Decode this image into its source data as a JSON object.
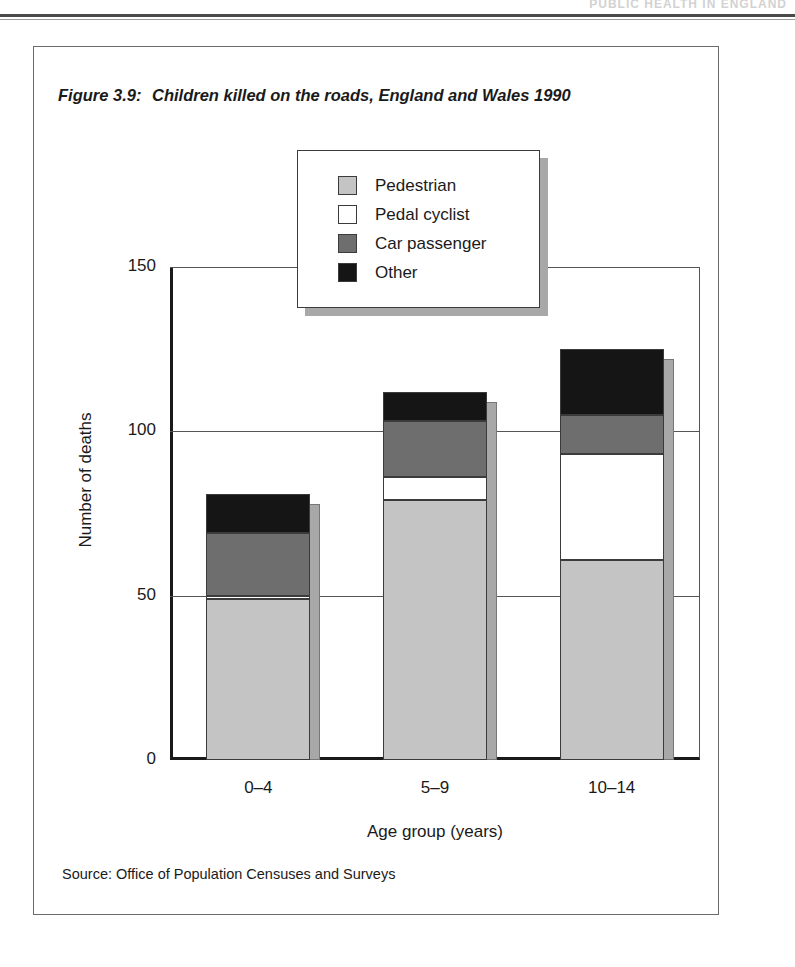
{
  "page_header": {
    "running_head": "PUBLIC HEALTH IN ENGLAND"
  },
  "figure": {
    "number_label": "Figure 3.9:",
    "caption": "Children killed on the roads, England and Wales 1990",
    "source": "Source: Office of Population Censuses and Surveys"
  },
  "legend": {
    "entries": [
      {
        "label": "Pedestrian",
        "color": "#c4c4c4"
      },
      {
        "label": "Pedal cyclist",
        "color": "#ffffff"
      },
      {
        "label": "Car passenger",
        "color": "#6e6e6e"
      },
      {
        "label": "Other",
        "color": "#151515"
      }
    ]
  },
  "chart_data": {
    "type": "bar",
    "subtype": "stacked",
    "title": "Children killed on the roads, England and Wales 1990",
    "xlabel": "Age group (years)",
    "ylabel": "Number of deaths",
    "categories": [
      "0–4",
      "5–9",
      "10–14"
    ],
    "ylim": [
      0,
      150
    ],
    "yticks": [
      0,
      50,
      100,
      150
    ],
    "ytick_labels": [
      "0",
      "50",
      "100",
      "150"
    ],
    "grid": true,
    "grid_axis": "y",
    "legend_position": "upper-center",
    "series": [
      {
        "name": "Pedestrian",
        "color": "#c4c4c4",
        "values": [
          49,
          79,
          61
        ]
      },
      {
        "name": "Pedal cyclist",
        "color": "#ffffff",
        "values": [
          1,
          7,
          32
        ]
      },
      {
        "name": "Car passenger",
        "color": "#6e6e6e",
        "values": [
          19,
          17,
          12
        ]
      },
      {
        "name": "Other",
        "color": "#151515",
        "values": [
          12,
          9,
          20
        ]
      }
    ],
    "totals": [
      81,
      112,
      125
    ],
    "annotations": [],
    "source": "Office of Population Censuses and Surveys"
  }
}
